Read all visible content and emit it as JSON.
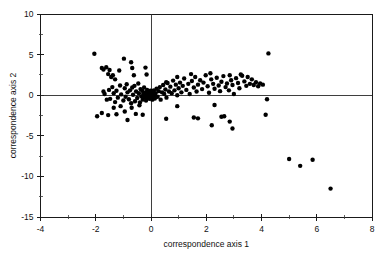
{
  "chart_data": {
    "type": "scatter",
    "title": "",
    "xlabel": "correspondence axis 1",
    "ylabel": "correspondence axis 2",
    "xlim": [
      -4,
      8
    ],
    "ylim": [
      -15,
      10
    ],
    "xticks": [
      -4,
      -2,
      0,
      2,
      4,
      6,
      8
    ],
    "xtick_labels": [
      "-4",
      "-2",
      "0",
      "2",
      "4",
      "6",
      "8"
    ],
    "xticks_minor": [
      -3,
      -1,
      1,
      3,
      5,
      7
    ],
    "yticks": [
      10,
      5,
      0,
      -5,
      -10,
      -15
    ],
    "ytick_labels": [
      "10",
      "5",
      "0",
      "-5",
      "-10",
      "-15"
    ],
    "yticks_minor": [
      7.5,
      2.5,
      -2.5,
      -7.5,
      -12.5
    ],
    "grid": false,
    "legend": null,
    "reference_lines": {
      "vertical_x": 0,
      "horizontal_y": 0
    },
    "marker": {
      "shape": "circle",
      "color": "#000000",
      "size_px": 2.2
    },
    "n_points": 171,
    "points": [
      [
        -2.05,
        5.1
      ],
      [
        -1.78,
        3.35
      ],
      [
        -1.72,
        3.15
      ],
      [
        -1.62,
        3.45
      ],
      [
        -1.55,
        2.6
      ],
      [
        -1.5,
        3.1
      ],
      [
        -1.44,
        2.25
      ],
      [
        -1.38,
        2.45
      ],
      [
        -1.3,
        1.95
      ],
      [
        -1.15,
        3.05
      ],
      [
        -0.98,
        4.5
      ],
      [
        -0.72,
        4.05
      ],
      [
        -0.68,
        3.35
      ],
      [
        -0.62,
        2.45
      ],
      [
        -0.2,
        3.4
      ],
      [
        -0.16,
        2.55
      ],
      [
        -1.72,
        0.45
      ],
      [
        -1.68,
        0.15
      ],
      [
        -1.6,
        -0.55
      ],
      [
        -1.52,
        0.65
      ],
      [
        -1.48,
        -0.45
      ],
      [
        -1.4,
        1.0
      ],
      [
        -1.35,
        0.25
      ],
      [
        -1.3,
        -0.85
      ],
      [
        -1.25,
        0.55
      ],
      [
        -1.2,
        -0.3
      ],
      [
        -1.12,
        1.2
      ],
      [
        -1.08,
        0.1
      ],
      [
        -1.0,
        -0.65
      ],
      [
        -0.95,
        0.85
      ],
      [
        -0.92,
        -0.2
      ],
      [
        -0.88,
        1.35
      ],
      [
        -0.85,
        0.35
      ],
      [
        -0.8,
        -0.5
      ],
      [
        -0.76,
        0.6
      ],
      [
        -0.72,
        -1.0
      ],
      [
        -0.68,
        0.95
      ],
      [
        -0.65,
        0.05
      ],
      [
        -0.6,
        1.15
      ],
      [
        -0.58,
        -0.75
      ],
      [
        -0.54,
        0.45
      ],
      [
        -0.5,
        -0.35
      ],
      [
        -0.46,
        1.45
      ],
      [
        -0.44,
        0.25
      ],
      [
        -0.4,
        -0.9
      ],
      [
        -0.38,
        0.75
      ],
      [
        -0.35,
        -0.15
      ],
      [
        -0.32,
        0.55
      ],
      [
        -0.3,
        -0.55
      ],
      [
        -0.28,
        0.15
      ],
      [
        -0.25,
        0.95
      ],
      [
        -0.23,
        -0.25
      ],
      [
        -0.2,
        0.35
      ],
      [
        -0.18,
        -0.65
      ],
      [
        -0.16,
        0.05
      ],
      [
        -0.14,
        0.65
      ],
      [
        -0.12,
        -0.35
      ],
      [
        -0.1,
        0.25
      ],
      [
        -0.08,
        -0.1
      ],
      [
        -0.06,
        0.45
      ],
      [
        -0.05,
        -0.45
      ],
      [
        -0.04,
        0.15
      ],
      [
        -0.03,
        -0.2
      ],
      [
        -0.02,
        0.55
      ],
      [
        -0.01,
        -0.05
      ],
      [
        0.0,
        0.3
      ],
      [
        0.02,
        -0.3
      ],
      [
        0.03,
        0.1
      ],
      [
        0.05,
        -0.55
      ],
      [
        0.06,
        0.4
      ],
      [
        0.08,
        -0.15
      ],
      [
        0.1,
        0.6
      ],
      [
        0.12,
        0.0
      ],
      [
        0.14,
        -0.4
      ],
      [
        0.16,
        0.25
      ],
      [
        0.2,
        0.8
      ],
      [
        0.24,
        -0.2
      ],
      [
        0.28,
        0.5
      ],
      [
        0.32,
        1.0
      ],
      [
        0.35,
        -0.55
      ],
      [
        0.4,
        0.35
      ],
      [
        0.44,
        1.25
      ],
      [
        0.48,
        0.15
      ],
      [
        0.52,
        0.7
      ],
      [
        0.56,
        -0.3
      ],
      [
        0.6,
        1.5
      ],
      [
        0.65,
        0.45
      ],
      [
        0.7,
        1.05
      ],
      [
        0.75,
        0.25
      ],
      [
        0.8,
        1.8
      ],
      [
        0.85,
        0.6
      ],
      [
        0.9,
        1.3
      ],
      [
        0.95,
        0.0
      ],
      [
        1.0,
        0.85
      ],
      [
        1.05,
        1.55
      ],
      [
        1.1,
        0.35
      ],
      [
        1.15,
        1.15
      ],
      [
        1.2,
        2.05
      ],
      [
        1.28,
        0.65
      ],
      [
        1.35,
        1.4
      ],
      [
        1.4,
        0.15
      ],
      [
        1.48,
        1.75
      ],
      [
        1.55,
        0.95
      ],
      [
        1.6,
        2.25
      ],
      [
        1.65,
        0.45
      ],
      [
        1.7,
        1.3
      ],
      [
        1.78,
        1.85
      ],
      [
        1.85,
        0.75
      ],
      [
        1.9,
        1.55
      ],
      [
        1.98,
        2.45
      ],
      [
        2.05,
        1.1
      ],
      [
        2.1,
        0.3
      ],
      [
        2.18,
        1.95
      ],
      [
        2.25,
        1.4
      ],
      [
        2.3,
        0.8
      ],
      [
        2.38,
        2.15
      ],
      [
        2.45,
        1.2
      ],
      [
        2.5,
        0.5
      ],
      [
        2.55,
        1.65
      ],
      [
        2.62,
        2.35
      ],
      [
        2.7,
        1.0
      ],
      [
        2.75,
        1.45
      ],
      [
        2.82,
        0.6
      ],
      [
        2.9,
        1.85
      ],
      [
        2.95,
        1.25
      ],
      [
        3.0,
        0.15
      ],
      [
        3.08,
        2.1
      ],
      [
        3.15,
        1.5
      ],
      [
        3.2,
        0.85
      ],
      [
        3.3,
        2.4
      ],
      [
        3.38,
        1.7
      ],
      [
        3.45,
        1.15
      ],
      [
        3.5,
        2.25
      ],
      [
        3.58,
        1.4
      ],
      [
        3.65,
        1.95
      ],
      [
        3.72,
        1.25
      ],
      [
        3.8,
        1.6
      ],
      [
        3.88,
        1.1
      ],
      [
        3.95,
        1.45
      ],
      [
        4.05,
        1.3
      ],
      [
        0.55,
        1.6
      ],
      [
        0.95,
        2.25
      ],
      [
        1.45,
        2.6
      ],
      [
        2.15,
        2.7
      ],
      [
        2.85,
        2.45
      ],
      [
        3.25,
        2.55
      ],
      [
        -1.95,
        -2.6
      ],
      [
        -1.78,
        -2.2
      ],
      [
        -1.55,
        -2.45
      ],
      [
        -1.35,
        -1.55
      ],
      [
        -1.25,
        -2.35
      ],
      [
        -1.1,
        -1.35
      ],
      [
        -0.95,
        -2.0
      ],
      [
        -0.85,
        -3.05
      ],
      [
        -0.7,
        -1.55
      ],
      [
        -0.55,
        -2.3
      ],
      [
        -0.42,
        -1.25
      ],
      [
        -0.3,
        -2.4
      ],
      [
        0.55,
        -2.9
      ],
      [
        0.95,
        -1.35
      ],
      [
        1.55,
        -2.75
      ],
      [
        1.7,
        -2.85
      ],
      [
        2.3,
        -1.2
      ],
      [
        2.55,
        -2.65
      ],
      [
        2.65,
        -2.6
      ],
      [
        2.85,
        -3.25
      ],
      [
        2.95,
        -4.1
      ],
      [
        2.2,
        -3.7
      ],
      [
        4.25,
        5.15
      ],
      [
        4.2,
        -0.5
      ],
      [
        4.15,
        -2.4
      ],
      [
        5.0,
        -7.85
      ],
      [
        5.4,
        -8.7
      ],
      [
        5.85,
        -7.95
      ],
      [
        6.5,
        -11.5
      ]
    ]
  }
}
